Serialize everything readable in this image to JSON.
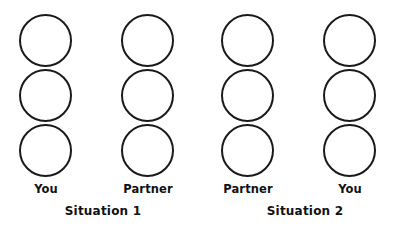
{
  "figure": {
    "background_color": "#ffffff",
    "stroke_color": "#1a1a1a",
    "text_color": "#111111",
    "columns": [
      {
        "role_label": "You",
        "circle_count": 3
      },
      {
        "role_label": "Partner",
        "circle_count": 3
      },
      {
        "role_label": "Partner",
        "circle_count": 3
      },
      {
        "role_label": "You",
        "circle_count": 3
      }
    ],
    "situations": [
      {
        "label": "Situation 1"
      },
      {
        "label": "Situation 2"
      }
    ]
  }
}
